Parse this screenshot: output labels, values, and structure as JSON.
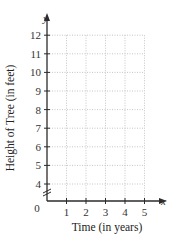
{
  "chart_data": {
    "type": "line",
    "title": "",
    "xlabel": "Time (in years)",
    "ylabel": "Height of Tree (in feet)",
    "x_axis_var": "x",
    "y_axis_var": "y",
    "origin_label": "0",
    "x_ticks": [
      "1",
      "2",
      "3",
      "4",
      "5"
    ],
    "y_ticks": [
      "4",
      "5",
      "6",
      "7",
      "8",
      "9",
      "10",
      "11",
      "12"
    ],
    "xlim": [
      0,
      5
    ],
    "ylim": [
      0,
      12
    ],
    "y_axis_break": true,
    "y_axis_break_between": [
      0,
      4
    ],
    "grid": true,
    "grid_style": "dotted",
    "series": [],
    "legend": null
  },
  "colors": {
    "axis": "#2b2b2b",
    "grid": "#b8b8b8",
    "text": "#333333"
  }
}
